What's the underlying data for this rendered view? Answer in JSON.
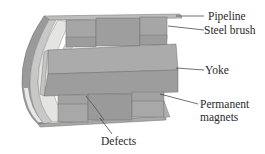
{
  "diagram": {
    "type": "3d-cutaway-schematic",
    "labels": {
      "pipeline": "Pipeline",
      "steel_brush": "Steel brush",
      "yoke": "Yoke",
      "permanent_magnets_line1": "Permanent",
      "permanent_magnets_line2": "magnets",
      "defects": "Defects"
    },
    "colors": {
      "background": "#ffffff",
      "pipe_dark": "#8f8f8f",
      "pipe_mid": "#b4b4b4",
      "pipe_light": "#dcdcdc",
      "ring_light": "#e6e6e2",
      "magnet": "#a3a3a3",
      "yoke_top": "#a9a9a9",
      "yoke_bottom": "#9c9c9c",
      "leader_line": "#333333",
      "text": "#2a2a2a"
    }
  }
}
